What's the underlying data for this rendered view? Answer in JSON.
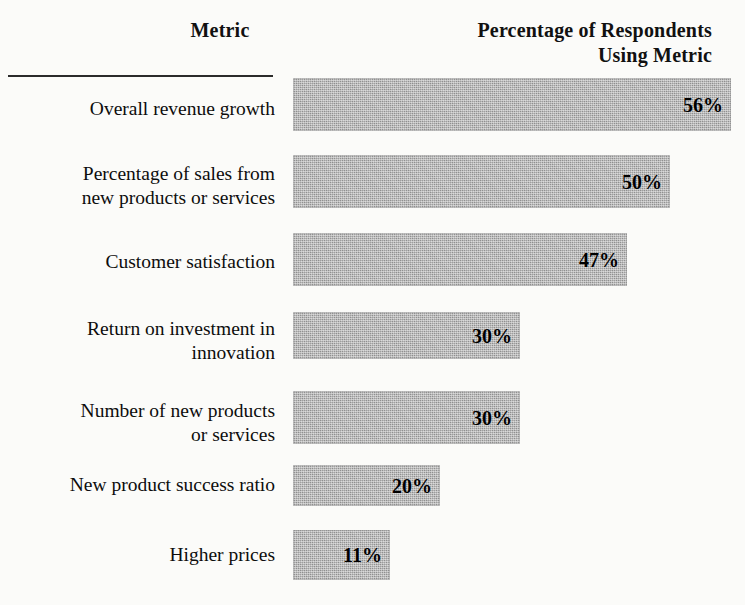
{
  "headers": {
    "metric": "Metric",
    "percentage_line1": "Percentage of Respondents",
    "percentage_line2": "Using Metric"
  },
  "chart_data": {
    "type": "bar",
    "orientation": "horizontal",
    "title": "",
    "xlabel": "Percentage of Respondents Using Metric",
    "ylabel": "Metric",
    "xlim": [
      0,
      56
    ],
    "grid": false,
    "legend": null,
    "value_suffix": "%",
    "bar_color": "#9a9a9a",
    "categories": [
      "Overall revenue growth",
      "Percentage of sales from new products or services",
      "Customer satisfaction",
      "Return on investment in innovation",
      "Number of new products or services",
      "New product success ratio",
      "Higher prices"
    ],
    "values": [
      56,
      50,
      47,
      30,
      30,
      20,
      11
    ],
    "value_labels": [
      "56%",
      "50%",
      "47%",
      "30%",
      "30%",
      "20%",
      "11%"
    ]
  },
  "rows": [
    {
      "label_line1": "Overall revenue growth",
      "label_line2": "",
      "value": 56,
      "value_label": "56%",
      "top": 78,
      "height": 53,
      "width": 438,
      "label_top": 97
    },
    {
      "label_line1": "Percentage of sales from",
      "label_line2": "new products or services",
      "value": 50,
      "value_label": "50%",
      "top": 155,
      "height": 53,
      "width": 377,
      "label_top": 162
    },
    {
      "label_line1": "Customer satisfaction",
      "label_line2": "",
      "value": 47,
      "value_label": "47%",
      "top": 233,
      "height": 53,
      "width": 334,
      "label_top": 250
    },
    {
      "label_line1": "Return on investment in",
      "label_line2": "innovation",
      "value": 30,
      "value_label": "30%",
      "top": 312,
      "height": 47,
      "width": 227,
      "label_top": 317
    },
    {
      "label_line1": "Number of new products",
      "label_line2": "or services",
      "value": 30,
      "value_label": "30%",
      "top": 391,
      "height": 53,
      "width": 227,
      "label_top": 399
    },
    {
      "label_line1": "New product success ratio",
      "label_line2": "",
      "value": 20,
      "value_label": "20%",
      "top": 465,
      "height": 41,
      "width": 147,
      "label_top": 473
    },
    {
      "label_line1": "Higher prices",
      "label_line2": "",
      "value": 11,
      "value_label": "11%",
      "top": 530,
      "height": 50,
      "width": 97,
      "label_top": 543
    }
  ]
}
